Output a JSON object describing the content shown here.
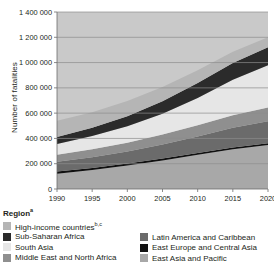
{
  "chart_data": {
    "type": "area",
    "stacked": true,
    "title": "",
    "xlabel": "Year",
    "ylabel": "Number of fatalities",
    "x": [
      1990,
      1995,
      2000,
      2005,
      2010,
      2015,
      2020
    ],
    "xlim": [
      1990,
      2020
    ],
    "ylim": [
      0,
      1400000
    ],
    "yticks": [
      0,
      200000,
      400000,
      600000,
      800000,
      1000000,
      1200000,
      1400000
    ],
    "ytick_labels": [
      "0",
      "200 000",
      "400 000",
      "600 000",
      "800 000",
      "1 000 000",
      "1 200 000",
      "1 400 000"
    ],
    "xticks": [
      1990,
      1995,
      2000,
      2005,
      2010,
      2015,
      2020
    ],
    "xtick_labels": [
      "1990",
      "1995",
      "2000",
      "2005",
      "2010",
      "2015",
      "2020"
    ],
    "grid": "horizontal",
    "legend_position": "below",
    "legend_title": "Region",
    "plot_background": "#c9c9c9",
    "stack_order_bottom_to_top": [
      "East Asia and Pacific",
      "East Europe and Central Asia",
      "Latin America and Caribbean",
      "Middle East and North Africa",
      "South Asia",
      "Sub-Saharan Africa",
      "High-income countries"
    ],
    "series": [
      {
        "name": "East Asia and Pacific",
        "color": "#a8a8a8",
        "values": [
          120000,
          150000,
          185000,
          225000,
          270000,
          315000,
          348000
        ]
      },
      {
        "name": "East Europe and Central Asia",
        "color": "#111111",
        "values": [
          18000,
          17000,
          16000,
          16000,
          15000,
          14000,
          13000
        ]
      },
      {
        "name": "Latin America and Caribbean",
        "color": "#6b6b6b",
        "values": [
          78000,
          85000,
          95000,
          110000,
          130000,
          155000,
          175000
        ]
      },
      {
        "name": "Middle East and North Africa",
        "color": "#8f8f8f",
        "values": [
          55000,
          62000,
          70000,
          80000,
          90000,
          100000,
          108000
        ]
      },
      {
        "name": "South Asia",
        "color": "#e6e6e6",
        "values": [
          85000,
          105000,
          130000,
          165000,
          215000,
          280000,
          335000
        ]
      },
      {
        "name": "Sub-Saharan Africa",
        "color": "#2b2b2b",
        "values": [
          55000,
          65000,
          80000,
          98000,
          118000,
          132000,
          142000
        ]
      },
      {
        "name": "High-income countries",
        "color": "#b5b5b5",
        "values": [
          128000,
          124000,
          120000,
          112000,
          102000,
          90000,
          79000
        ]
      }
    ]
  },
  "legend": {
    "title": "Region",
    "title_superscript": "a",
    "left_column": [
      {
        "label": "High-income countries",
        "superscript": "b,c",
        "color": "#b5b5b5"
      },
      {
        "label": "Sub-Saharan Africa",
        "superscript": "",
        "color": "#2b2b2b"
      },
      {
        "label": "South Asia",
        "superscript": "",
        "color": "#e6e6e6"
      },
      {
        "label": "Middle East and North Africa",
        "superscript": "",
        "color": "#8f8f8f"
      }
    ],
    "right_column": [
      {
        "label": "Latin America and Caribbean",
        "superscript": "",
        "color": "#6b6b6b"
      },
      {
        "label": "East Europe and Central Asia",
        "superscript": "",
        "color": "#111111"
      },
      {
        "label": "East Asia and Pacific",
        "superscript": "",
        "color": "#a8a8a8"
      }
    ]
  }
}
